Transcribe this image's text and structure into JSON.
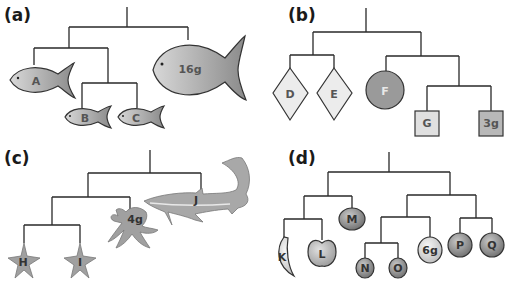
{
  "figure": {
    "panels": [
      {
        "id": "a",
        "label": "(a)",
        "shape": "fish",
        "leaves": [
          {
            "label": "A"
          },
          {
            "label": "B"
          },
          {
            "label": "C"
          },
          {
            "label": "16g"
          }
        ],
        "tree": "((A,(B,C)),16g)"
      },
      {
        "id": "b",
        "label": "(b)",
        "shape": "geometric",
        "leaves": [
          {
            "label": "D",
            "shape": "diamond"
          },
          {
            "label": "E",
            "shape": "diamond"
          },
          {
            "label": "F",
            "shape": "circle"
          },
          {
            "label": "G",
            "shape": "square"
          },
          {
            "label": "3g",
            "shape": "square"
          }
        ],
        "tree": "((D,E),(F,(G,3g)))"
      },
      {
        "id": "c",
        "label": "(c)",
        "shape": "marine-animals",
        "leaves": [
          {
            "label": "H",
            "shape": "starfish"
          },
          {
            "label": "I",
            "shape": "starfish"
          },
          {
            "label": "4g",
            "shape": "octopus"
          },
          {
            "label": "J",
            "shape": "shark"
          }
        ],
        "tree": "(((H,I),4g),J)"
      },
      {
        "id": "d",
        "label": "(d)",
        "shape": "fruit",
        "leaves": [
          {
            "label": "K",
            "shape": "banana"
          },
          {
            "label": "L",
            "shape": "apple"
          },
          {
            "label": "M",
            "shape": "round-fruit"
          },
          {
            "label": "N",
            "shape": "round-fruit"
          },
          {
            "label": "O",
            "shape": "round-fruit"
          },
          {
            "label": "6g",
            "shape": "round-fruit"
          },
          {
            "label": "P",
            "shape": "round-fruit"
          },
          {
            "label": "Q",
            "shape": "round-fruit"
          }
        ],
        "tree": "(((K,L),M),(((N,O),6g),(P,Q)))"
      }
    ],
    "colors": {
      "line": "#2a2a2a",
      "fill_mid_gray": "#9a9a9a",
      "fill_light_gray": "#e6e6e6",
      "fill_dark_gray": "#8e8e8e",
      "label_gray": "#555555"
    }
  }
}
